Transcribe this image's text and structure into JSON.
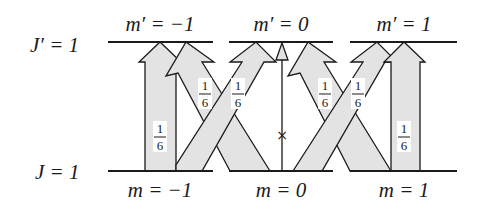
{
  "diagram": {
    "upper_level": {
      "label": "J′ = 1",
      "sublevels": [
        {
          "label": "m′ = −1"
        },
        {
          "label": "m′ = 0"
        },
        {
          "label": "m′ = 1"
        }
      ]
    },
    "lower_level": {
      "label": "J = 1",
      "sublevels": [
        {
          "label": "m = −1"
        },
        {
          "label": "m = 0"
        },
        {
          "label": "m = 1"
        }
      ]
    },
    "transitions": [
      {
        "from": "m = -1",
        "to": "m' = -1",
        "strength_num": "1",
        "strength_den": "6"
      },
      {
        "from": "m = -1",
        "to": "m' = 0",
        "strength_num": "1",
        "strength_den": "6"
      },
      {
        "from": "m = 0",
        "to": "m' = -1",
        "strength_num": "1",
        "strength_den": "6"
      },
      {
        "from": "m = 0",
        "to": "m' = 0",
        "forbidden_mark": "×"
      },
      {
        "from": "m = 0",
        "to": "m' = 1",
        "strength_num": "1",
        "strength_den": "6"
      },
      {
        "from": "m = 1",
        "to": "m' = 0",
        "strength_num": "1",
        "strength_den": "6"
      },
      {
        "from": "m = 1",
        "to": "m' = 1",
        "strength_num": "1",
        "strength_den": "6"
      }
    ],
    "colors": {
      "arrow_fill": "#e3e3e3",
      "line": "#1a1a1a"
    }
  }
}
